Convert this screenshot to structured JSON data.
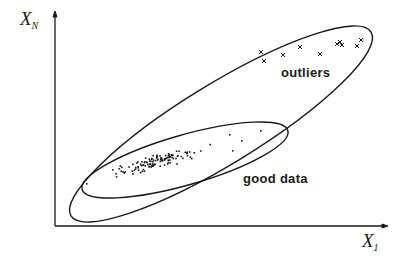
{
  "diagram": {
    "axes": {
      "y_label": {
        "main": "X",
        "sub": "N"
      },
      "x_label": {
        "main": "X",
        "sub": "1"
      }
    },
    "labels": {
      "outliers": "outliers",
      "good_data": "good data"
    },
    "colors": {
      "ink": "#1a1a1a",
      "background": "#ffffff"
    },
    "regions": [
      {
        "name": "outer-ellipse",
        "encloses": "good data and outliers"
      },
      {
        "name": "inner-ellipse",
        "encloses": "good data"
      }
    ],
    "outlier_points": [
      [
        261,
        52
      ],
      [
        264,
        61
      ],
      [
        283,
        55
      ],
      [
        300,
        47
      ],
      [
        320,
        54
      ],
      [
        337,
        44
      ],
      [
        340,
        42
      ],
      [
        342,
        45
      ],
      [
        357,
        46
      ],
      [
        361,
        40
      ]
    ]
  }
}
